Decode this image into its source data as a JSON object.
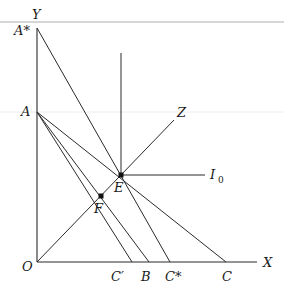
{
  "diagram": {
    "type": "economics-budget-constraint-diagram",
    "axes": {
      "x_label": "X",
      "y_label": "Y",
      "origin_label": "O"
    },
    "y_intercepts": [
      {
        "id": "A_star",
        "label": "A*"
      },
      {
        "id": "A",
        "label": "A"
      }
    ],
    "x_intercepts": [
      {
        "id": "C_prime",
        "label": "C′"
      },
      {
        "id": "B",
        "label": "B"
      },
      {
        "id": "C_star",
        "label": "C*"
      },
      {
        "id": "C",
        "label": "C"
      }
    ],
    "points": [
      {
        "id": "E",
        "label": "E"
      },
      {
        "id": "F",
        "label": "F"
      }
    ],
    "curves": [
      {
        "id": "I0",
        "label": "I",
        "subscript": "0"
      },
      {
        "id": "Z",
        "label": "Z"
      }
    ],
    "lines": [
      {
        "from": "A_star",
        "to": "C_star"
      },
      {
        "from": "A",
        "to": "C"
      },
      {
        "from": "A",
        "to": "B"
      },
      {
        "from": "A",
        "to": "C_prime"
      },
      {
        "from": "O",
        "to": "Z"
      }
    ],
    "colors": {
      "line": "#2a2a2a",
      "background": "#ffffff",
      "rule": "#c8c8c8"
    }
  }
}
